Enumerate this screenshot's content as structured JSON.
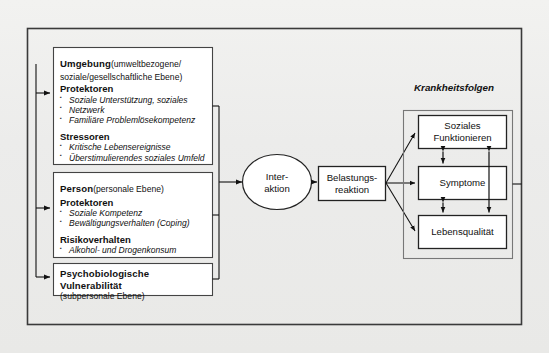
{
  "diagram": {
    "left_column": {
      "boxes": [
        {
          "id": "umgebung",
          "title": "Umgebung",
          "title_suffix": "(umweltbezogene/",
          "title_line2": "soziale/gesellschaftliche Ebene)",
          "sections": [
            {
              "heading": "Protektoren",
              "items": [
                "Soziale Unterstützung, soziales",
                "Netzwerk",
                "Familiäre Problemlösekompetenz"
              ]
            },
            {
              "heading": "Stressoren",
              "items": [
                "Kritische Lebensereignisse",
                "Überstimulierendes soziales Umfeld"
              ]
            }
          ]
        },
        {
          "id": "person",
          "title": "Person",
          "title_suffix": "(personale Ebene)",
          "title_line2": "",
          "sections": [
            {
              "heading": "Protektoren",
              "items": [
                "Soziale Kompetenz",
                "Bewältigungsverhalten (Coping)"
              ]
            },
            {
              "heading": "Risikoverhalten",
              "items": [
                "Alkohol- und Drogenkonsum"
              ]
            }
          ]
        },
        {
          "id": "vulnerabilitaet",
          "title": "Psychobiologische Vulnerabilität",
          "title_suffix": "",
          "title_line2": "(subpersonale Ebene)",
          "sections": []
        }
      ]
    },
    "interaction_node": {
      "line1": "Inter-",
      "line2": "aktion"
    },
    "reaction_node": {
      "line1": "Belastungs-",
      "line2": "reaktion"
    },
    "outcome_group": {
      "title": "Krankheitsfolgen",
      "boxes": [
        {
          "id": "soziales-funktionieren",
          "line1": "Soziales",
          "line2": "Funktionieren"
        },
        {
          "id": "symptome",
          "line1": "Symptome",
          "line2": ""
        },
        {
          "id": "lebensqualitaet",
          "line1": "Lebensqualität",
          "line2": ""
        }
      ]
    },
    "colors": {
      "stroke": "#1a1a1a",
      "box_fill": "#ffffff",
      "background": "#ececea",
      "text": "#111111"
    }
  }
}
